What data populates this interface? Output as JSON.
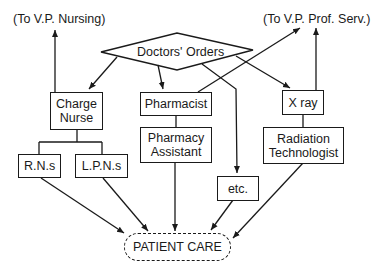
{
  "diagram": {
    "title": "",
    "external_targets": {
      "vp_nursing": "(To V.P. Nursing)",
      "vp_prof_serv": "(To V.P. Prof. Serv.)"
    },
    "decision": {
      "label": "Doctors' Orders",
      "shape": "diamond"
    },
    "nodes": {
      "charge_nurse": "Charge\nNurse",
      "charge_nurse_line1": "Charge",
      "charge_nurse_line2": "Nurse",
      "pharmacist": "Pharmacist",
      "pharmacy_assistant_line1": "Pharmacy",
      "pharmacy_assistant_line2": "Assistant",
      "xray": "X ray",
      "radiation_tech_line1": "Radiation",
      "radiation_tech_line2": "Technologist",
      "rns": "R.N.s",
      "lpns": "L.P.N.s",
      "etc": "etc."
    },
    "terminal": {
      "label": "PATIENT CARE",
      "shape": "dashed-rounded"
    },
    "edges": [
      {
        "from": "Doctors' Orders",
        "to": "Charge Nurse",
        "type": "arrow"
      },
      {
        "from": "Doctors' Orders",
        "to": "Pharmacist",
        "type": "arrow"
      },
      {
        "from": "Doctors' Orders",
        "to": "X ray",
        "type": "arrow"
      },
      {
        "from": "Doctors' Orders",
        "to": "etc.",
        "type": "arrow"
      },
      {
        "from": "Pharmacist",
        "to": "(To V.P. Prof. Serv.)",
        "type": "arrow"
      },
      {
        "from": "Charge Nurse",
        "to": "(To V.P. Nursing)",
        "type": "arrow"
      },
      {
        "from": "X ray",
        "to": "(To V.P. Prof. Serv.)",
        "type": "arrow"
      },
      {
        "from": "Charge Nurse",
        "to": "R.N.s",
        "type": "line"
      },
      {
        "from": "Charge Nurse",
        "to": "L.P.N.s",
        "type": "line"
      },
      {
        "from": "Pharmacist",
        "to": "Pharmacy Assistant",
        "type": "line"
      },
      {
        "from": "X ray",
        "to": "Radiation Technologist",
        "type": "line"
      },
      {
        "from": "R.N.s",
        "to": "PATIENT CARE",
        "type": "arrow"
      },
      {
        "from": "L.P.N.s",
        "to": "PATIENT CARE",
        "type": "arrow"
      },
      {
        "from": "Pharmacy Assistant",
        "to": "PATIENT CARE",
        "type": "arrow"
      },
      {
        "from": "etc.",
        "to": "PATIENT CARE",
        "type": "arrow"
      },
      {
        "from": "Radiation Technologist",
        "to": "PATIENT CARE",
        "type": "arrow"
      }
    ]
  }
}
